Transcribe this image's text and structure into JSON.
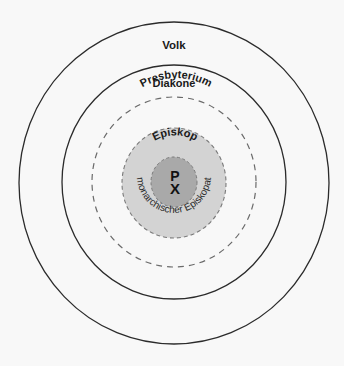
{
  "diagram": {
    "title": "",
    "colors": {
      "background": "#f8f8f8",
      "stroke": "#2b2b2b",
      "dashed_stroke": "#6a6a6a",
      "episkop_fill": "#d3d3d3",
      "center_fill": "#a9a9a9",
      "text": "#1a1a1a"
    },
    "rings": [
      {
        "id": "volk",
        "label": "Volk",
        "style": "solid"
      },
      {
        "id": "diakone",
        "label": "Diakone",
        "style": "solid"
      },
      {
        "id": "presbyterium",
        "label": "Presbyterium",
        "style": "dashed"
      },
      {
        "id": "episkop",
        "label": "Episkop",
        "style": "dashed",
        "fill": "light-grey"
      },
      {
        "id": "center",
        "label": "",
        "style": "dashed",
        "fill": "mid-grey"
      }
    ],
    "center_symbol": {
      "name": "chi-rho-icon",
      "top_glyph": "P",
      "bottom_glyph": "X"
    },
    "arc_caption": "monarchischer Episkopat"
  }
}
